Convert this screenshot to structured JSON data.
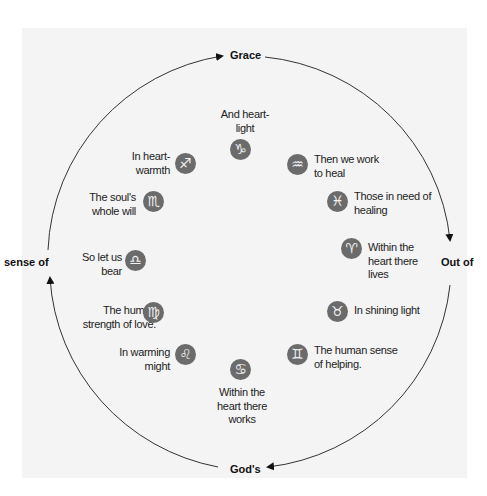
{
  "diagram": {
    "type": "zodiac-circle",
    "colors": {
      "background": "#ffffff",
      "panel": "#f4f4f4",
      "sign_fill": "#6b6b6b",
      "sign_glyph": "#f2f2f2",
      "ring": "#333333",
      "text": "#222222"
    },
    "cardinal_labels": {
      "top": "Grace",
      "right": "Out of",
      "bottom": "God's",
      "left": "sense of"
    },
    "signs": [
      {
        "name": "capricorn",
        "glyph": "♑",
        "text": "And heart-light"
      },
      {
        "name": "aquarius",
        "glyph": "♒",
        "text": "Then we work to heal"
      },
      {
        "name": "pisces",
        "glyph": "♓",
        "text": "Those in need of healing"
      },
      {
        "name": "aries",
        "glyph": "♈",
        "text": "Within the heart there lives"
      },
      {
        "name": "taurus",
        "glyph": "♉",
        "text": "In shining light"
      },
      {
        "name": "gemini",
        "glyph": "♊",
        "text": "The human sense of helping."
      },
      {
        "name": "cancer",
        "glyph": "♋",
        "text": "Within the heart there works"
      },
      {
        "name": "leo",
        "glyph": "♌",
        "text": "In warming might"
      },
      {
        "name": "virgo",
        "glyph": "♍",
        "text": "The human strength of love."
      },
      {
        "name": "libra",
        "glyph": "♎",
        "text": "So let us bear"
      },
      {
        "name": "scorpio",
        "glyph": "♏",
        "text": "The soul's whole will"
      },
      {
        "name": "sagittarius",
        "glyph": "♐",
        "text": "In heart-warmth"
      }
    ],
    "label_lines": {
      "capricorn": [
        "And heart-",
        "light"
      ],
      "aquarius": [
        "Then we work",
        "to heal"
      ],
      "pisces": [
        "Those in need of",
        "healing"
      ],
      "aries": [
        "Within the",
        "heart there",
        "lives"
      ],
      "taurus": [
        "In shining light"
      ],
      "gemini": [
        "The human sense",
        "of helping."
      ],
      "cancer": [
        "Within the",
        "heart there",
        "works"
      ],
      "leo": [
        "In warming",
        "might"
      ],
      "virgo": [
        "The human",
        "strength of love."
      ],
      "libra": [
        "So let us",
        "bear"
      ],
      "scorpio": [
        "The soul's",
        "whole will"
      ],
      "sagittarius": [
        "In heart-",
        "warmth"
      ]
    }
  }
}
